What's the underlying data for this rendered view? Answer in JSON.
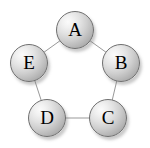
{
  "figure": {
    "title": "",
    "background_color": "#ffffff",
    "width": 150,
    "height": 148
  },
  "style": {
    "node_fill_light": "#fbfbfb",
    "node_fill_dark": "#949494",
    "node_border_color": "#6f6f6f",
    "node_shadow_color": "#787878",
    "edge_color": "#999999",
    "label_color": "#000000",
    "node_diameter": 38,
    "edge_width": 1
  },
  "graph_data": {
    "type": "diagram",
    "graph_kind": "cycle",
    "directed": false,
    "node_count": 5,
    "edge_count": 5,
    "nodes": [
      {
        "id": "A",
        "label": "A",
        "cx": 75,
        "cy": 30
      },
      {
        "id": "B",
        "label": "B",
        "cx": 121,
        "cy": 63
      },
      {
        "id": "C",
        "label": "C",
        "cx": 108,
        "cy": 118
      },
      {
        "id": "D",
        "label": "D",
        "cx": 47,
        "cy": 118
      },
      {
        "id": "E",
        "label": "E",
        "cx": 29,
        "cy": 63
      }
    ],
    "edges": [
      {
        "source": "A",
        "target": "B"
      },
      {
        "source": "B",
        "target": "C"
      },
      {
        "source": "C",
        "target": "D"
      },
      {
        "source": "D",
        "target": "E"
      },
      {
        "source": "E",
        "target": "A"
      }
    ],
    "ring": {
      "center_x": 75,
      "center_y": 76,
      "radius": 47
    }
  }
}
